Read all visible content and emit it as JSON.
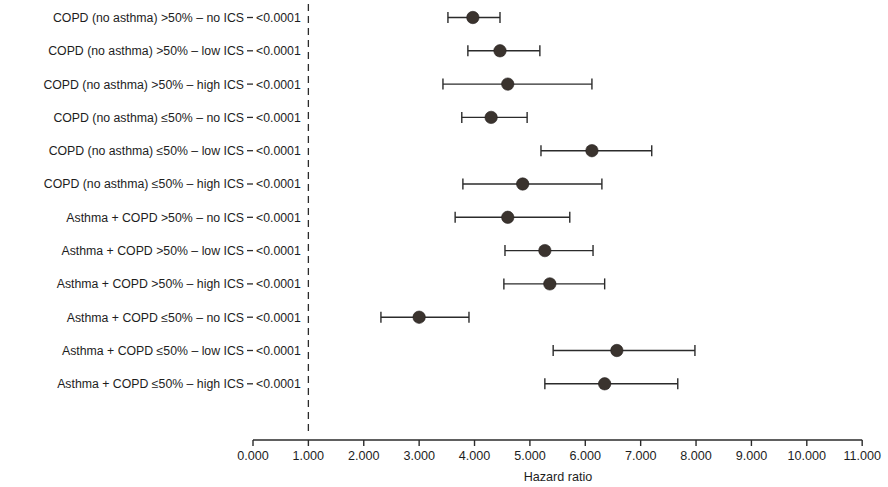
{
  "figure": {
    "type": "forest-plot",
    "background_color": "#ffffff",
    "marker_color": "#3a332e",
    "line_color": "#2b2b2b"
  },
  "axis": {
    "title": "Hazard ratio",
    "tick_labels": [
      "0.000",
      "1.000",
      "2.000",
      "3.000",
      "4.000",
      "5.000",
      "6.000",
      "7.000",
      "8.000",
      "9.000",
      "10.000",
      "11.000"
    ],
    "tick_values": [
      0,
      1,
      2,
      3,
      4,
      5,
      6,
      7,
      8,
      9,
      10,
      11
    ],
    "reference_line_value": 1.0
  },
  "chart_data": {
    "type": "scatter",
    "title": "",
    "subtitle": "",
    "xlabel": "Hazard ratio",
    "ylabel": "",
    "xlim": [
      0,
      11
    ],
    "grid": false,
    "legend": "none",
    "reference_line": 1.0,
    "pvalue_column_header": "",
    "categories": [
      "COPD (no asthma) >50% – no ICS",
      "COPD (no asthma) >50% – low ICS",
      "COPD (no asthma) >50% – high ICS",
      "COPD (no asthma) ≤50% – no ICS",
      "COPD (no asthma) ≤50% – low ICS",
      "COPD (no asthma) ≤50% – high ICS",
      "Asthma + COPD >50% – no ICS",
      "Asthma + COPD >50% – low ICS",
      "Asthma + COPD >50% – high ICS",
      "Asthma + COPD ≤50% – no ICS",
      "Asthma + COPD ≤50% – low ICS",
      "Asthma + COPD ≤50% – high ICS"
    ],
    "values": [
      3.97,
      4.46,
      4.6,
      4.3,
      6.12,
      4.87,
      4.6,
      5.27,
      5.36,
      3.0,
      6.57,
      6.35
    ],
    "ci_lower": [
      3.52,
      3.88,
      3.43,
      3.77,
      5.2,
      3.79,
      3.65,
      4.55,
      4.53,
      2.31,
      5.42,
      5.27
    ],
    "ci_upper": [
      4.46,
      5.18,
      6.12,
      4.95,
      7.2,
      6.3,
      5.72,
      6.14,
      6.35,
      3.9,
      7.98,
      7.67
    ],
    "p_values": [
      "<0.0001",
      "<0.0001",
      "<0.0001",
      "<0.0001",
      "<0.0001",
      "<0.0001",
      "<0.0001",
      "<0.0001",
      "<0.0001",
      "<0.0001",
      "<0.0001",
      "<0.0001"
    ]
  }
}
